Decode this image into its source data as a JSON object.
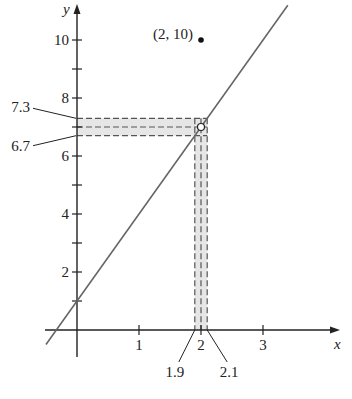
{
  "chart_data": {
    "type": "line",
    "title": "",
    "xlabel": "x",
    "ylabel": "y",
    "xlim": [
      -0.5,
      4.3
    ],
    "ylim": [
      -0.5,
      11.3
    ],
    "x_ticks": [
      {
        "v": 1,
        "label": "1"
      },
      {
        "v": 2,
        "label": "2"
      },
      {
        "v": 3,
        "label": "3"
      }
    ],
    "y_ticks": [
      {
        "v": 1,
        "label": ""
      },
      {
        "v": 2,
        "label": "2"
      },
      {
        "v": 3,
        "label": ""
      },
      {
        "v": 4,
        "label": "4"
      },
      {
        "v": 5,
        "label": ""
      },
      {
        "v": 6,
        "label": "6"
      },
      {
        "v": 7,
        "label": ""
      },
      {
        "v": 8,
        "label": "8"
      },
      {
        "v": 9,
        "label": ""
      },
      {
        "v": 10,
        "label": "10"
      }
    ],
    "series": [
      {
        "name": "line",
        "slope": 3,
        "intercept": 1,
        "x_range": [
          -0.5,
          3.4
        ]
      }
    ],
    "points": [
      {
        "x": 2,
        "y": 10,
        "style": "filled",
        "label": "(2, 10)"
      },
      {
        "x": 2,
        "y": 7,
        "style": "open",
        "label": ""
      }
    ],
    "x_band": {
      "low": 1.9,
      "center": 2,
      "high": 2.1,
      "low_label": "1.9",
      "high_label": "2.1"
    },
    "y_band": {
      "low": 6.7,
      "center": 7,
      "high": 7.3,
      "low_label": "6.7",
      "high_label": "7.3"
    },
    "colors": {
      "line": "#666666",
      "band_fill": "#e6e6e6",
      "axis": "#222222",
      "dash": "#555555"
    }
  }
}
